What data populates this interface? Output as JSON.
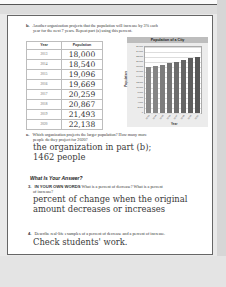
{
  "problem_b": {
    "number": "b.",
    "prompt_line1": "Another organization projects that the population will increase by 3% each",
    "prompt_line2": "year for the next 7 years. Repeat part (a) using this percent.",
    "table": {
      "headers": [
        "Year",
        "Population"
      ],
      "rows": [
        {
          "year": "2013",
          "population": "18,000"
        },
        {
          "year": "2014",
          "population": "18,540"
        },
        {
          "year": "2015",
          "population": "19,096"
        },
        {
          "year": "2016",
          "population": "19,669"
        },
        {
          "year": "2017",
          "population": "20,259"
        },
        {
          "year": "2018",
          "population": "20,867"
        },
        {
          "year": "2019",
          "population": "21,493"
        },
        {
          "year": "2020",
          "population": "22,138"
        }
      ]
    }
  },
  "chart_data": {
    "type": "bar",
    "title": "Population of a City",
    "xlabel": "Year",
    "ylabel": "Population",
    "categories": [
      "2013",
      "2014",
      "2015",
      "2016",
      "2017",
      "2018",
      "2019",
      "2020"
    ],
    "values": [
      18000,
      18540,
      19096,
      19669,
      20259,
      20867,
      21493,
      22138
    ],
    "ylim": [
      0,
      26000
    ],
    "yticks": [
      "26,000",
      "24,000",
      "22,000",
      "20,000",
      "18,000",
      "16,000",
      "14,000",
      "12,000",
      "10,000",
      "8,000",
      "6,000",
      "4,000",
      "2,000",
      "0"
    ],
    "grid": true,
    "bar_colors": [
      "#8a8a8a",
      "#858585",
      "#7c7c7c",
      "#747474",
      "#6c6c6c",
      "#656565",
      "#5e5e5e",
      "#575757"
    ]
  },
  "problem_c": {
    "number": "c.",
    "prompt_line1": "Which organization projects the larger population? How many more",
    "prompt_line2": "people do they project for 2020?",
    "answer_line1": "the organization in part (b);",
    "answer_line2": "1462 people"
  },
  "section": {
    "heading": "What Is Your Answer?"
  },
  "problem_3": {
    "number": "3.",
    "lead": "IN YOUR OWN WORDS",
    "prompt_line1": "What is a percent of decrease? What is a percent",
    "prompt_line2": "of increase?",
    "answer_line1": "percent of change when the original",
    "answer_line2": "amount decreases or increases"
  },
  "problem_4": {
    "number": "4.",
    "prompt": "Describe real-life examples of a percent of decrease and a percent of increase.",
    "answer": "Check students' work."
  }
}
